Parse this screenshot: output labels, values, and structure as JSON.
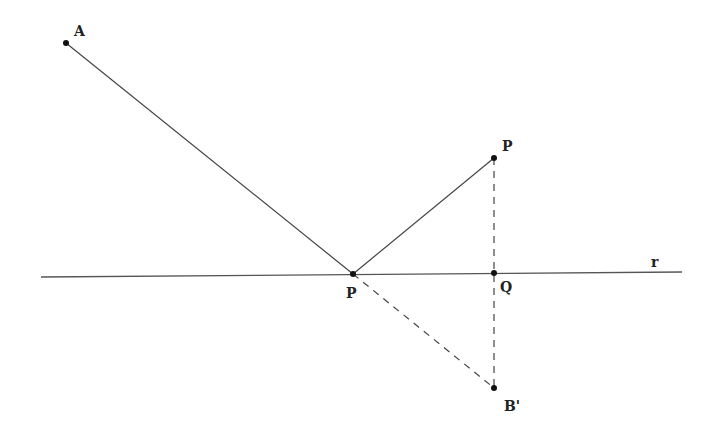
{
  "diagram": {
    "colors": {
      "stroke": "#444444",
      "point": "#111111",
      "background": "#ffffff"
    },
    "points": {
      "A": {
        "label": "A",
        "x": 66,
        "y": 43
      },
      "P1": {
        "label": "P",
        "x": 353,
        "y": 274
      },
      "P2": {
        "label": "P",
        "x": 494,
        "y": 158
      },
      "Q": {
        "label": "Q",
        "x": 494,
        "y": 273
      },
      "B": {
        "label": "B'",
        "x": 494,
        "y": 388
      }
    },
    "line_label": "r",
    "segments": [
      {
        "from": "A",
        "to": "P1",
        "style": "solid"
      },
      {
        "from": "P1",
        "to": "P2",
        "style": "solid"
      },
      {
        "from": "P1",
        "to": "B",
        "style": "dashed"
      },
      {
        "from": "P2",
        "to": "B",
        "style": "dashed"
      }
    ]
  }
}
